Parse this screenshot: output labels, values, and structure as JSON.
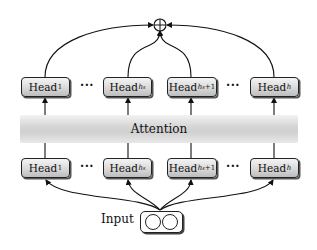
{
  "diagram": {
    "type": "multi-head attention with head grouping",
    "top_row": {
      "heads": [
        {
          "base": "Head",
          "sub": "1"
        },
        {
          "base": "Head",
          "sub": "h_s"
        },
        {
          "base": "Head",
          "sub": "h_s+1"
        },
        {
          "base": "Head",
          "sub": "h"
        }
      ],
      "ellipses": [
        "···",
        "···"
      ]
    },
    "attention_band": {
      "label": "Attention",
      "color": "#d4d4d4"
    },
    "bottom_row": {
      "heads": [
        {
          "base": "Head",
          "sub": "1"
        },
        {
          "base": "Head",
          "sub": "h_s"
        },
        {
          "base": "Head",
          "sub": "h_s+1"
        },
        {
          "base": "Head",
          "sub": "h"
        }
      ],
      "ellipses": [
        "···",
        "···"
      ]
    },
    "combine_node": {
      "symbol": "⊕",
      "meaning": "sum/aggregation"
    },
    "input": {
      "label": "Input",
      "circles": 2
    },
    "edges": [
      "Input → Head_1 (bottom)",
      "Input → Head_h_s (bottom)",
      "Input → Head_h_s+1 (bottom)",
      "Input → Head_h (bottom)",
      "Head_1 (bottom) → Head_1 (top)",
      "Head_h_s (bottom) → Head_h_s (top)",
      "Head_h_s+1 (bottom) → Head_h_s+1 (top)",
      "Head_h (bottom) → Head_h (top)",
      "Head_1 (top) → ⊕",
      "Head_h_s (top) → ⊕",
      "Head_h_s+1 (top) → ⊕",
      "Head_h (top) → ⊕"
    ]
  },
  "labels": {
    "head": "Head",
    "sub_1": "1",
    "sub_hs": "h",
    "sub_hs_s": "s",
    "sub_hs1_tail": "+1",
    "sub_h": "h",
    "dots": "···",
    "attention": "Attention",
    "input": "Input"
  }
}
